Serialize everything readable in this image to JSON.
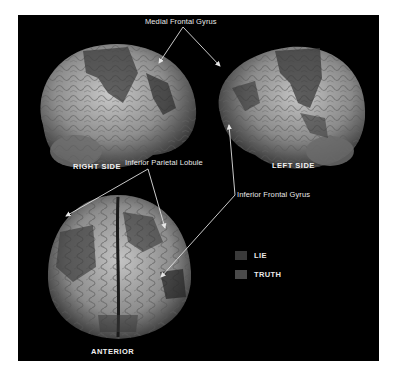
{
  "figure": {
    "views": [
      {
        "id": "right",
        "label": "RIGHT SIDE"
      },
      {
        "id": "left",
        "label": "LEFT SIDE"
      },
      {
        "id": "anterior",
        "label": "ANTERIOR"
      }
    ],
    "annotations": {
      "medial_frontal": "Medial Frontal Gyrus",
      "inferior_parietal": "Inferior Parietal Lobule",
      "inferior_frontal": "Inferior Frontal Gyrus"
    },
    "legend": {
      "items": [
        {
          "label": "LIE",
          "color": "#3a3a3a"
        },
        {
          "label": "TRUTH",
          "color": "#4a4a4a"
        }
      ]
    },
    "colors": {
      "background": "#000000",
      "annotation_line": "#e0e0e0",
      "brain_surface": "#a8a8a8"
    }
  }
}
